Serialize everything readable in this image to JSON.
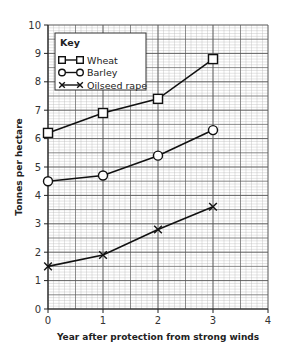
{
  "chart_data": {
    "type": "line",
    "title": "",
    "xlabel": "Year after protection from strong winds",
    "ylabel": "Tonnes per hectare",
    "x": [
      0,
      1,
      2,
      3
    ],
    "xlim": [
      0,
      4
    ],
    "ylim": [
      0,
      10
    ],
    "x_ticks": [
      "0",
      "1",
      "2",
      "3",
      "4"
    ],
    "y_ticks": [
      "0",
      "1",
      "2",
      "3",
      "4",
      "5",
      "6",
      "7",
      "8",
      "9",
      "10"
    ],
    "grid": true,
    "grid_style": "graph paper (major every 1 unit, minor every 0.1 unit)",
    "legend_title": "Key",
    "legend_position": "upper left, inside plot",
    "series": [
      {
        "name": "Wheat",
        "marker": "square",
        "values": [
          6.2,
          6.9,
          7.4,
          8.8
        ]
      },
      {
        "name": "Barley",
        "marker": "circle",
        "values": [
          4.5,
          4.7,
          5.4,
          6.3
        ]
      },
      {
        "name": "Oilseed rape",
        "marker": "cross",
        "values": [
          1.5,
          1.9,
          2.8,
          3.6
        ]
      }
    ]
  },
  "colors": {
    "line": "#111111",
    "grid_major": "#555555",
    "grid_minor": "#b8b8b8",
    "background": "#ffffff"
  }
}
